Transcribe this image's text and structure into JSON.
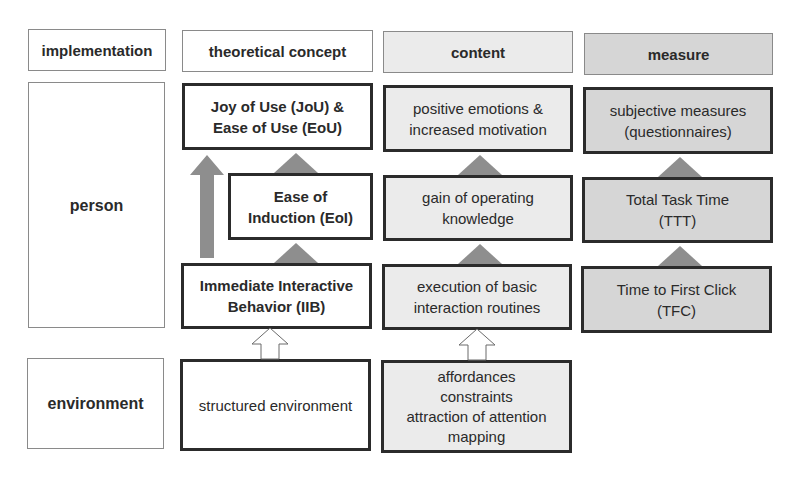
{
  "headers": {
    "implementation": "implementation",
    "theoretical_concept": "theoretical concept",
    "content": "content",
    "measure": "measure"
  },
  "rows": {
    "person": "person",
    "environment": "environment"
  },
  "theoretical": {
    "jou_eou": "Joy of Use (JoU) &\nEase of Use (EoU)",
    "eoi": "Ease of\nInduction (EoI)",
    "iib": "Immediate Interactive\nBehavior (IIB)",
    "structured_env": "structured environment"
  },
  "content": {
    "emotions": "positive emotions &\nincreased motivation",
    "knowledge": "gain of operating\nknowledge",
    "routines": "execution of basic\ninteraction routines",
    "affordances": "affordances\nconstraints\nattraction of attention\nmapping"
  },
  "measure": {
    "subjective": "subjective measures\n(questionnaires)",
    "ttt": "Total Task Time\n(TTT)",
    "tfc": "Time to First Click\n(TFC)"
  },
  "colors": {
    "content_fill": "#ebebeb",
    "measure_fill": "#d6d6d6",
    "arrow_fill": "#8e8e8e",
    "border_dark": "#2b2b2b"
  }
}
